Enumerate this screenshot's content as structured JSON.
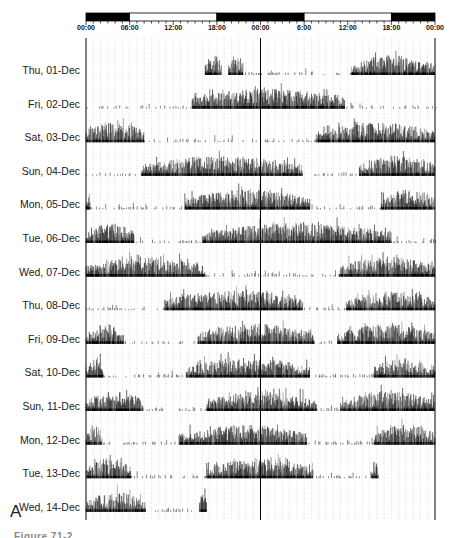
{
  "figure": {
    "panel_letter": "A",
    "caption": "Figure 71-2"
  },
  "chart_data": {
    "type": "actogram",
    "title": "",
    "xlabel": "Time of day (double-plotted, 48 h)",
    "ylabel": "",
    "x_range_hours": [
      0,
      48
    ],
    "grid": "vertical dotted lines every hour; solid line at 24 h",
    "tick_labels": [
      "00:00",
      "06:00",
      "12:00",
      "18:00",
      "00:00",
      "6:00",
      "12:00",
      "18:00",
      "00:00"
    ],
    "tick_hours": [
      0,
      6,
      12,
      18,
      24,
      30,
      36,
      42,
      48
    ],
    "light_dark_bar": [
      {
        "start": 0,
        "end": 6,
        "state": "dark"
      },
      {
        "start": 6,
        "end": 18,
        "state": "light"
      },
      {
        "start": 18,
        "end": 30,
        "state": "dark"
      },
      {
        "start": 30,
        "end": 42,
        "state": "light"
      },
      {
        "start": 42,
        "end": 48,
        "state": "dark"
      }
    ],
    "rows": [
      {
        "label": "Thu, 01-Dec",
        "active": [
          [
            16.4,
            18.6
          ],
          [
            19.6,
            21.6
          ],
          [
            36.5,
            48
          ]
        ],
        "sparse": [
          [
            21.6,
            36.5
          ]
        ],
        "start_hour": 16.4
      },
      {
        "label": "Fri, 02-Dec",
        "active": [
          [
            14.6,
            35.6
          ]
        ],
        "sparse": [
          [
            0,
            14.6
          ],
          [
            35.6,
            48
          ]
        ]
      },
      {
        "label": "Sat, 03-Dec",
        "active": [
          [
            0,
            8
          ],
          [
            31.6,
            48
          ]
        ],
        "sparse": [
          [
            8,
            31.6
          ]
        ]
      },
      {
        "label": "Sun, 04-Dec",
        "active": [
          [
            7.6,
            29.8
          ],
          [
            37.6,
            48
          ]
        ],
        "sparse": [
          [
            0,
            7.6
          ],
          [
            29.8,
            37.6
          ]
        ]
      },
      {
        "label": "Mon, 05-Dec",
        "active": [
          [
            0,
            0.6
          ],
          [
            13.6,
            30.8
          ],
          [
            40.6,
            48
          ]
        ],
        "sparse": [
          [
            0.6,
            13.6
          ],
          [
            30.8,
            40.6
          ]
        ]
      },
      {
        "label": "Tue, 06-Dec",
        "active": [
          [
            0,
            6.6
          ],
          [
            16,
            42
          ]
        ],
        "sparse": [
          [
            6.6,
            16
          ],
          [
            42,
            48
          ]
        ]
      },
      {
        "label": "Wed, 07-Dec",
        "active": [
          [
            0,
            16.4
          ],
          [
            34.8,
            48
          ]
        ],
        "sparse": [
          [
            16.4,
            34.8
          ]
        ]
      },
      {
        "label": "Thu, 08-Dec",
        "active": [
          [
            10.8,
            29.8
          ],
          [
            35.8,
            48
          ]
        ],
        "sparse": [
          [
            0,
            10.8
          ],
          [
            29.8,
            35.8
          ]
        ]
      },
      {
        "label": "Fri, 09-Dec",
        "active": [
          [
            0,
            5.2
          ],
          [
            15.4,
            31.4
          ],
          [
            34.6,
            48
          ]
        ],
        "sparse": [
          [
            5.2,
            15.4
          ],
          [
            31.4,
            34.6
          ]
        ]
      },
      {
        "label": "Sat, 10-Dec",
        "active": [
          [
            0,
            2.4
          ],
          [
            13.8,
            30.8
          ],
          [
            39.6,
            48
          ]
        ],
        "sparse": [
          [
            2.4,
            13.8
          ],
          [
            30.8,
            39.6
          ]
        ]
      },
      {
        "label": "Sun, 11-Dec",
        "active": [
          [
            0,
            7.8
          ],
          [
            16.6,
            31.8
          ],
          [
            35,
            48
          ]
        ],
        "sparse": [
          [
            7.8,
            16.6
          ],
          [
            31.8,
            35
          ]
        ]
      },
      {
        "label": "Mon, 12-Dec",
        "active": [
          [
            0,
            2.2
          ],
          [
            12.8,
            30.4
          ],
          [
            39.6,
            48
          ]
        ],
        "sparse": [
          [
            2.2,
            12.8
          ],
          [
            30.4,
            39.6
          ]
        ]
      },
      {
        "label": "Tue, 13-Dec",
        "active": [
          [
            0,
            6.2
          ],
          [
            16.6,
            31.2
          ],
          [
            39.2,
            40.2
          ]
        ],
        "sparse": [
          [
            6.2,
            16.6
          ],
          [
            31.2,
            39.2
          ]
        ]
      },
      {
        "label": "Wed, 14-Dec",
        "active": [
          [
            0,
            8.2
          ],
          [
            15.6,
            16.6
          ]
        ],
        "sparse": [
          [
            8.2,
            15.6
          ]
        ]
      }
    ]
  }
}
